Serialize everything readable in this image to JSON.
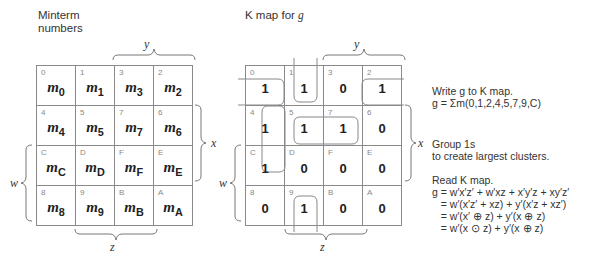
{
  "left_panel": {
    "title_line1": "Minterm",
    "title_line2": "numbers",
    "label_y": "y",
    "label_x": "x",
    "label_w": "w",
    "label_z": "z",
    "rows": [
      [
        {
          "idx": "0",
          "m": "m",
          "sub": "0"
        },
        {
          "idx": "1",
          "m": "m",
          "sub": "1"
        },
        {
          "idx": "3",
          "m": "m",
          "sub": "3"
        },
        {
          "idx": "2",
          "m": "m",
          "sub": "2"
        }
      ],
      [
        {
          "idx": "4",
          "m": "m",
          "sub": "4"
        },
        {
          "idx": "5",
          "m": "m",
          "sub": "5"
        },
        {
          "idx": "7",
          "m": "m",
          "sub": "7"
        },
        {
          "idx": "6",
          "m": "m",
          "sub": "6"
        }
      ],
      [
        {
          "idx": "C",
          "m": "m",
          "sub": "C"
        },
        {
          "idx": "D",
          "m": "m",
          "sub": "D"
        },
        {
          "idx": "F",
          "m": "m",
          "sub": "F"
        },
        {
          "idx": "E",
          "m": "m",
          "sub": "E"
        }
      ],
      [
        {
          "idx": "8",
          "m": "m",
          "sub": "8"
        },
        {
          "idx": "9",
          "m": "m",
          "sub": "9"
        },
        {
          "idx": "B",
          "m": "m",
          "sub": "B"
        },
        {
          "idx": "A",
          "m": "m",
          "sub": "A"
        }
      ]
    ]
  },
  "right_panel": {
    "title_prefix": "K map for ",
    "title_var": "g",
    "label_y": "y",
    "label_x": "x",
    "label_w": "w",
    "label_z": "z",
    "rows": [
      [
        {
          "idx": "0",
          "v": "1"
        },
        {
          "idx": "1",
          "v": "1"
        },
        {
          "idx": "3",
          "v": "0"
        },
        {
          "idx": "2",
          "v": "1"
        }
      ],
      [
        {
          "idx": "4",
          "v": "1"
        },
        {
          "idx": "5",
          "v": "1"
        },
        {
          "idx": "7",
          "v": "1"
        },
        {
          "idx": "6",
          "v": "0"
        }
      ],
      [
        {
          "idx": "C",
          "v": "1"
        },
        {
          "idx": "D",
          "v": "0"
        },
        {
          "idx": "F",
          "v": "0"
        },
        {
          "idx": "E",
          "v": "0"
        }
      ],
      [
        {
          "idx": "8",
          "v": "0"
        },
        {
          "idx": "9",
          "v": "1"
        },
        {
          "idx": "B",
          "v": "0"
        },
        {
          "idx": "A",
          "v": "0"
        }
      ]
    ],
    "groups": [
      "m0+m2 (wrap around)",
      "m1+m9 (wrap around)",
      "m4+mC",
      "m5+m7"
    ]
  },
  "annotations": {
    "step1_line1": "Write g to K map.",
    "step1_line2": "g = Σm(0,1,2,4,5,7,9,C)",
    "step2_line1": "Group 1s",
    "step2_line2": "to create largest clusters.",
    "step3_title": "Read K map.",
    "eq1": "g = w′x′z′ + w′xz + x′y′z + xy′z′",
    "eq2": "   = w′(x′z′ + xz) + y′(x′z + xz′)",
    "eq3": "   = w′(x′ ⊕ z) + y′(x ⊕ z)",
    "eq4": "   = w′(x ⊙ z) + y′(x ⊕ z)"
  }
}
